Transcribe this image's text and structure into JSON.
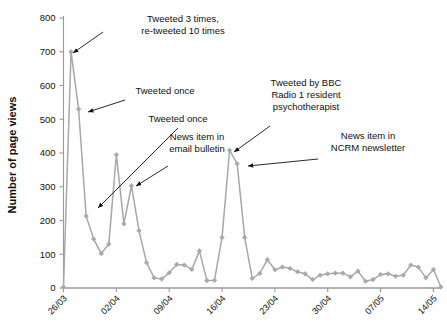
{
  "chart_data": {
    "type": "line",
    "title": "",
    "xlabel": "",
    "ylabel": "Number of page views",
    "ylim": [
      0,
      800
    ],
    "yticks": [
      0,
      100,
      200,
      300,
      400,
      500,
      600,
      700,
      800
    ],
    "xticks": [
      "26/03",
      "02/04",
      "09/04",
      "16/04",
      "23/04",
      "30/04",
      "07/05",
      "14/05"
    ],
    "xtick_days": [
      0,
      7,
      14,
      21,
      28,
      35,
      42,
      49
    ],
    "xlim_days": [
      0,
      50
    ],
    "grid": false,
    "legend": null,
    "series_color": "#a8a8a8",
    "marker": "diamond",
    "x": [
      0,
      1,
      2,
      3,
      4,
      5,
      6,
      7,
      8,
      9,
      10,
      11,
      12,
      13,
      14,
      15,
      16,
      17,
      18,
      19,
      20,
      21,
      22,
      23,
      24,
      25,
      26,
      27,
      28,
      29,
      30,
      31,
      32,
      33,
      34,
      35,
      36,
      37,
      38,
      39,
      40,
      41,
      42,
      43,
      44,
      45,
      46,
      47,
      48,
      49,
      50
    ],
    "values": [
      3,
      700,
      530,
      213,
      145,
      102,
      130,
      395,
      190,
      303,
      170,
      75,
      30,
      27,
      45,
      70,
      68,
      55,
      110,
      22,
      23,
      150,
      408,
      368,
      150,
      28,
      43,
      84,
      54,
      62,
      58,
      48,
      42,
      25,
      38,
      42,
      44,
      44,
      33,
      50,
      20,
      25,
      40,
      42,
      35,
      38,
      68,
      62,
      30,
      55,
      3
    ],
    "dates": [
      "26/03",
      "27/03",
      "28/03",
      "29/03",
      "30/03",
      "31/03",
      "01/04",
      "02/04",
      "03/04",
      "04/04",
      "05/04",
      "06/04",
      "07/04",
      "08/04",
      "09/04",
      "10/04",
      "11/04",
      "12/04",
      "13/04",
      "14/04",
      "15/04",
      "16/04",
      "17/04",
      "18/04",
      "19/04",
      "20/04",
      "21/04",
      "22/04",
      "23/04",
      "24/04",
      "25/04",
      "26/04",
      "27/04",
      "28/04",
      "29/04",
      "30/04",
      "01/05",
      "02/05",
      "03/05",
      "04/05",
      "05/05",
      "06/05",
      "07/05",
      "08/05",
      "09/05",
      "10/05",
      "11/05",
      "12/05",
      "13/05",
      "14/05",
      "15/05"
    ],
    "annotations": [
      {
        "id": "tweeted-3-times",
        "lines": [
          "Tweeted 3 times,",
          "re-tweeted 10 times"
        ],
        "text_x": 183,
        "text_y": 22,
        "text_anchor": "middle",
        "arrow_from": [
          103,
          32
        ],
        "arrow_to": [
          73,
          53
        ],
        "target_point_index": 1,
        "target_value": 700
      },
      {
        "id": "tweeted-once-1",
        "lines": [
          "Tweeted once"
        ],
        "text_x": 165,
        "text_y": 94,
        "text_anchor": "middle",
        "arrow_from": [
          125,
          100
        ],
        "arrow_to": [
          88,
          112
        ],
        "target_point_index": 2,
        "target_value": 530
      },
      {
        "id": "tweeted-once-2",
        "lines": [
          "Tweeted once"
        ],
        "text_x": 178,
        "text_y": 122,
        "text_anchor": "middle",
        "arrow_from": [
          178,
          128
        ],
        "arrow_to": [
          98,
          208
        ],
        "target_point_index": 3,
        "target_value": 213
      },
      {
        "id": "news-item-email-bulletin",
        "lines": [
          "News item in",
          "email bulletin"
        ],
        "text_x": 197,
        "text_y": 140,
        "text_anchor": "middle",
        "arrow_from": [
          168,
          166
        ],
        "arrow_to": [
          136,
          186
        ],
        "target_point_index": 9,
        "target_value": 303
      },
      {
        "id": "tweeted-by-bbc",
        "lines": [
          "Tweeted by BBC",
          "Radio 1 resident",
          "psychotherapist"
        ],
        "text_x": 306,
        "text_y": 86,
        "text_anchor": "middle",
        "arrow_from": [
          270,
          126
        ],
        "arrow_to": [
          234,
          152
        ],
        "target_point_index": 22,
        "target_value": 408
      },
      {
        "id": "news-item-ncrm-newsletter",
        "lines": [
          "News item in",
          "NCRM newsletter"
        ],
        "text_x": 368,
        "text_y": 139,
        "text_anchor": "middle",
        "arrow_from": [
          318,
          159
        ],
        "arrow_to": [
          248,
          166
        ],
        "target_point_index": 23,
        "target_value": 368
      }
    ]
  },
  "axes": {
    "ylabel": "Number of page views",
    "ytick_labels": [
      "0",
      "100",
      "200",
      "300",
      "400",
      "500",
      "600",
      "700",
      "800"
    ],
    "xtick_labels": [
      "26/03",
      "02/04",
      "09/04",
      "16/04",
      "23/04",
      "30/04",
      "07/05",
      "14/05"
    ]
  },
  "style": {
    "series_color": "#a8a8a8",
    "axis_color": "#9a9a9a",
    "text_color": "#111111",
    "background": "#ffffff"
  }
}
